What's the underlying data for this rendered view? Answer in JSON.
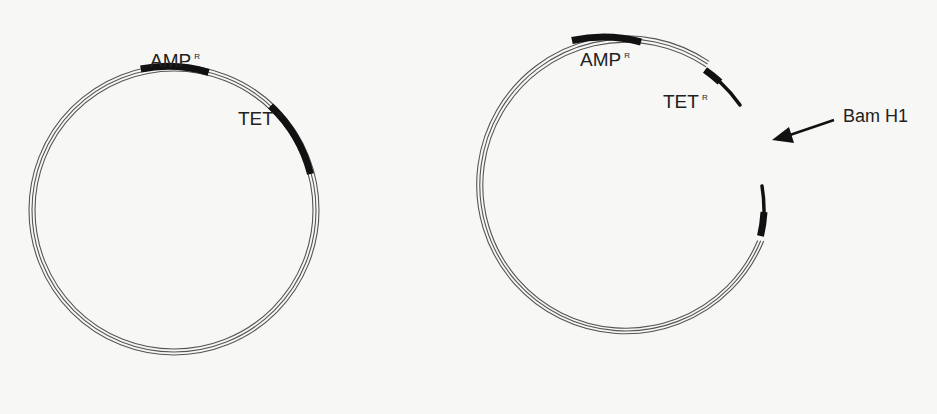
{
  "figure": {
    "left_plasmid": {
      "labels": {
        "amp": "AMP",
        "amp_sup": "R",
        "tet": "TET",
        "tet_sup": "R"
      }
    },
    "right_plasmid": {
      "labels": {
        "amp": "AMP",
        "amp_sup": "R",
        "tet": "TET",
        "tet_sup": "R"
      },
      "cut_site_label": "Bam H1"
    },
    "colors": {
      "background": "#f7f7f5",
      "strand": "#555555",
      "gene_block": "#111111",
      "text": "#222222"
    }
  }
}
